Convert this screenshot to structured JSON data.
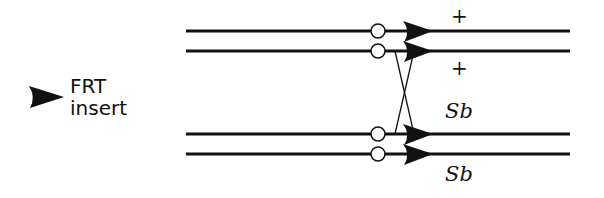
{
  "legend": {
    "icon": "frt-arrowhead-icon",
    "line1": "FRT",
    "line2": "insert"
  },
  "chromosomes": [
    {
      "id": "top-1",
      "label": "+",
      "y": 31
    },
    {
      "id": "top-2",
      "label": "+",
      "y": 51
    },
    {
      "id": "bottom-1",
      "label": "Sb",
      "y": 134
    },
    {
      "id": "bottom-2",
      "label": "Sb",
      "y": 154
    }
  ],
  "labels": {
    "plus_upper": "+",
    "plus_lower": "+",
    "sb_upper": "Sb",
    "sb_lower": "Sb"
  },
  "colors": {
    "ink": "#111111",
    "background": "#ffffff"
  }
}
